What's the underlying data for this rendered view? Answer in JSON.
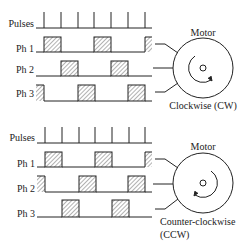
{
  "panels": [
    {
      "id": "cw",
      "labels": {
        "pulses": "Pulses",
        "ph1": "Ph 1",
        "ph2": "Ph 2",
        "ph3": "Ph 3"
      },
      "motor_label": "Motor",
      "direction_label": [
        "Clockwise (CW)"
      ],
      "sequence": [
        "Ph1",
        "Ph2",
        "Ph3"
      ]
    },
    {
      "id": "ccw",
      "labels": {
        "pulses": "Pulses",
        "ph1": "Ph 1",
        "ph2": "Ph 2",
        "ph3": "Ph 3"
      },
      "motor_label": "Motor",
      "direction_label": [
        "Counter-clockwise",
        "(CCW)"
      ],
      "sequence": [
        "Ph1",
        "Ph3",
        "Ph2"
      ]
    }
  ],
  "colors": {
    "line": "#222222",
    "hatch": "#555555"
  }
}
